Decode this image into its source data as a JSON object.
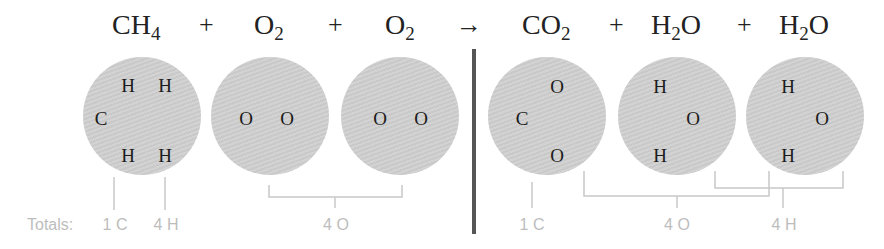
{
  "equation": {
    "reactants": [
      {
        "id": "ch4",
        "base": "CH",
        "sub": "4",
        "tail": "",
        "label_x": 112
      },
      {
        "id": "o2a",
        "base": "O",
        "sub": "2",
        "tail": "",
        "label_x": 254
      },
      {
        "id": "o2b",
        "base": "O",
        "sub": "2",
        "tail": "",
        "label_x": 385
      }
    ],
    "products": [
      {
        "id": "co2",
        "base": "CO",
        "sub": "2",
        "tail": "",
        "label_x": 522
      },
      {
        "id": "h2o_a",
        "base": "H",
        "sub": "2",
        "tail": "O",
        "label_x": 651
      },
      {
        "id": "h2o_b",
        "base": "H",
        "sub": "2",
        "tail": "O",
        "label_x": 779
      }
    ],
    "plus_symbol": "+",
    "arrow_symbol": "→",
    "operators": [
      {
        "symbol": "+",
        "x": 199
      },
      {
        "symbol": "+",
        "x": 328
      },
      {
        "symbol": "→",
        "x": 456
      },
      {
        "symbol": "+",
        "x": 609
      },
      {
        "symbol": "+",
        "x": 737
      }
    ]
  },
  "molecules": [
    {
      "name": "methane",
      "cx": 142,
      "atoms": [
        {
          "el": "H",
          "x": 128,
          "y": 85
        },
        {
          "el": "H",
          "x": 165,
          "y": 85
        },
        {
          "el": "C",
          "x": 101,
          "y": 118
        },
        {
          "el": "H",
          "x": 128,
          "y": 155
        },
        {
          "el": "H",
          "x": 165,
          "y": 155
        }
      ]
    },
    {
      "name": "oxygen-1",
      "cx": 270,
      "atoms": [
        {
          "el": "O",
          "x": 246,
          "y": 118
        },
        {
          "el": "O",
          "x": 287,
          "y": 118
        }
      ]
    },
    {
      "name": "oxygen-2",
      "cx": 400,
      "atoms": [
        {
          "el": "O",
          "x": 380,
          "y": 118
        },
        {
          "el": "O",
          "x": 421,
          "y": 118
        }
      ]
    },
    {
      "name": "carbon-dioxide",
      "cx": 547,
      "atoms": [
        {
          "el": "O",
          "x": 557,
          "y": 86
        },
        {
          "el": "C",
          "x": 522,
          "y": 118
        },
        {
          "el": "O",
          "x": 557,
          "y": 155
        }
      ]
    },
    {
      "name": "water-1",
      "cx": 677,
      "atoms": [
        {
          "el": "H",
          "x": 660,
          "y": 86
        },
        {
          "el": "O",
          "x": 693,
          "y": 118
        },
        {
          "el": "H",
          "x": 660,
          "y": 155
        }
      ]
    },
    {
      "name": "water-2",
      "cx": 805,
      "atoms": [
        {
          "el": "H",
          "x": 788,
          "y": 86
        },
        {
          "el": "O",
          "x": 822,
          "y": 118
        },
        {
          "el": "H",
          "x": 788,
          "y": 155
        }
      ]
    }
  ],
  "totals": {
    "label": "Totals:",
    "reactants": [
      {
        "text": "1 C",
        "x": 115
      },
      {
        "text": "4 H",
        "x": 166
      },
      {
        "text": "4 O",
        "x": 336
      }
    ],
    "products": [
      {
        "text": "1 C",
        "x": 532
      },
      {
        "text": "4 O",
        "x": 677
      },
      {
        "text": "4 H",
        "x": 784
      }
    ]
  },
  "colors": {
    "molecule_fill": "#cfcfcf",
    "divider": "#555555",
    "bracket": "#c8c8c8",
    "totals_text": "#bdbdbd",
    "formula_text": "#222222"
  }
}
